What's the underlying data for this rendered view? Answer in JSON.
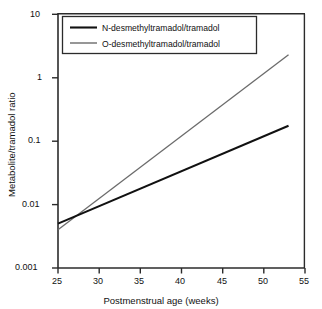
{
  "chart_data": {
    "type": "line",
    "title": "",
    "xlabel": "Postmenstrual age (weeks)",
    "ylabel": "Metabolite/tramadol ratio",
    "xlim": [
      25,
      55
    ],
    "ylim": [
      0.001,
      10
    ],
    "yscale": "log",
    "xscale": "linear",
    "grid": false,
    "legend_position": "top-left-inside",
    "xticks": [
      25,
      30,
      35,
      40,
      45,
      50,
      55
    ],
    "xtick_labels": [
      "25",
      "30",
      "35",
      "40",
      "45",
      "50",
      "55"
    ],
    "yticks": [
      0.001,
      0.01,
      0.1,
      1,
      10
    ],
    "ytick_labels": [
      "0.001",
      "0.01",
      "0.1",
      "1",
      "10"
    ],
    "series": [
      {
        "name": "N-desmethyltramadol/tramadol",
        "color": "#111111",
        "line_width": 2.0,
        "x": [
          25,
          53
        ],
        "values": [
          0.005,
          0.175
        ]
      },
      {
        "name": "O-desmethyltramadol/tramadol",
        "color": "#6b6b6b",
        "line_width": 1.3,
        "x": [
          25,
          53
        ],
        "values": [
          0.004,
          2.3
        ]
      }
    ],
    "annotations": []
  },
  "legend": {
    "entries": [
      {
        "label": "N-desmethyltramadol/tramadol"
      },
      {
        "label": "O-desmethyltramadol/tramadol"
      }
    ]
  },
  "axes": {
    "x_title": "Postmenstrual age (weeks)",
    "y_title": "Metabolite/tramadol ratio",
    "x_tick_labels": [
      "25",
      "30",
      "35",
      "40",
      "45",
      "50",
      "55"
    ],
    "y_tick_labels": [
      "10",
      "1",
      "0.1",
      "0.01",
      "0.001"
    ]
  }
}
